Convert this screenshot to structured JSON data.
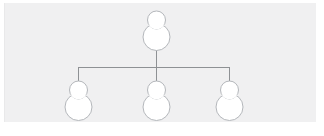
{
  "canvas": {
    "width": 324,
    "height": 136,
    "background_color": "#ffffff",
    "panel_color": "#f0f0f1"
  },
  "diagram": {
    "type": "org-chart",
    "title": "Organization hierarchy",
    "node_count": 4,
    "level_count": 2,
    "icon_name": "person-icon",
    "icon_style": {
      "stroke_color": "#b4b7bb",
      "fill_color": "#ffffff",
      "stroke_width": 1
    },
    "connector_style": {
      "stroke_color": "#8e9194",
      "stroke_width": 1,
      "shape": "orthogonal"
    },
    "root": {
      "id": "root",
      "label": "",
      "icon": "person-icon",
      "x": 156,
      "y": 28
    },
    "children": [
      {
        "id": "child-1",
        "label": "",
        "icon": "person-icon",
        "x": 78,
        "y": 98
      },
      {
        "id": "child-2",
        "label": "",
        "icon": "person-icon",
        "x": 156,
        "y": 98
      },
      {
        "id": "child-3",
        "label": "",
        "icon": "person-icon",
        "x": 229,
        "y": 98
      }
    ],
    "connectors": {
      "root_stem": {
        "x": 156,
        "y_start": 48,
        "y_end": 67
      },
      "horizontal_bar": {
        "y": 67,
        "x_start": 78,
        "x_end": 229
      },
      "child_stems_y_end": 82
    }
  }
}
